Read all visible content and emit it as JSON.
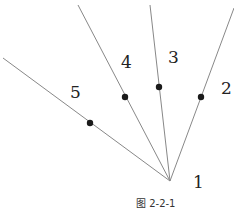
{
  "diagram": {
    "caption": "图 2-2-1",
    "origin": {
      "label": "1",
      "x": 170,
      "y": 181
    },
    "rays": [
      {
        "id": "2",
        "label": "2",
        "end": {
          "x": 234,
          "y": 8
        },
        "dot": {
          "x": 201,
          "y": 97
        },
        "label_pos": {
          "x": 221,
          "y": 80
        }
      },
      {
        "id": "3",
        "label": "3",
        "end": {
          "x": 150,
          "y": 5
        },
        "dot": {
          "x": 159,
          "y": 87
        },
        "label_pos": {
          "x": 168,
          "y": 49
        }
      },
      {
        "id": "4",
        "label": "4",
        "end": {
          "x": 78,
          "y": 5
        },
        "dot": {
          "x": 125,
          "y": 97
        },
        "label_pos": {
          "x": 121,
          "y": 54
        }
      },
      {
        "id": "5",
        "label": "5",
        "end": {
          "x": 3,
          "y": 58
        },
        "dot": {
          "x": 90,
          "y": 123
        },
        "label_pos": {
          "x": 70,
          "y": 84
        }
      }
    ],
    "colors": {
      "line": "#888888",
      "dot": "#1a1a1a",
      "text": "#222222"
    }
  }
}
